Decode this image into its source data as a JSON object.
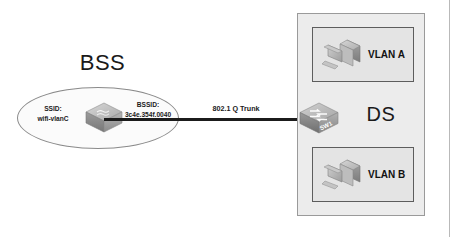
{
  "diagram": {
    "title": "BSS",
    "bss": {
      "label": "BSS",
      "ssid_caption": "SSID:",
      "ssid_value": "wifi-vlanC",
      "bssid_caption": "BSSID:",
      "bssid_value": "3c4e.354f.0040",
      "ap_icon": "access-point-icon"
    },
    "link": {
      "label": "802.1 Q Trunk"
    },
    "switch": {
      "name": "SW1",
      "icon": "switch-icon"
    },
    "ds": {
      "label": "DS",
      "vlans": [
        {
          "label": "VLAN A",
          "icon": "workstation-icon"
        },
        {
          "label": "VLAN B",
          "icon": "workstation-icon"
        }
      ]
    },
    "colors": {
      "background": "#ffffff",
      "ds_fill": "#ececec",
      "vlan_fill": "#e4e4e4",
      "vlan_stroke": "#5d5d5d",
      "ellipse_stroke": "#8a8a8a",
      "link_stroke": "#1b1b1b",
      "text": "#1a1a1a"
    }
  }
}
